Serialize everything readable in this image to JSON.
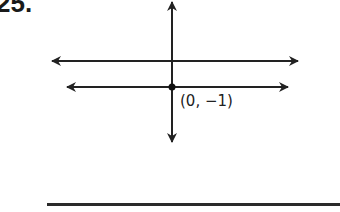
{
  "problem": {
    "number_label": "25."
  },
  "diagram": {
    "point_label": "(0, −1)",
    "lines": [
      {
        "name": "upper-horizontal-line",
        "y": 61,
        "x1": 50,
        "x2": 300
      },
      {
        "name": "lower-horizontal-line",
        "y": 87,
        "x1": 65,
        "x2": 290
      }
    ],
    "vertical_axis": {
      "x": 172,
      "y1": 0,
      "y2": 144
    },
    "point": {
      "x": 172,
      "y": 87
    },
    "stroke_color": "#222222"
  },
  "answer": {
    "blank_line": true
  }
}
